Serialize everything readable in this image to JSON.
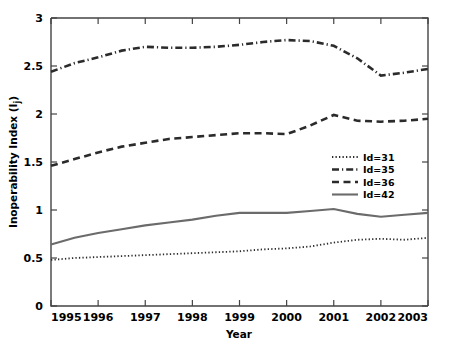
{
  "chart_data": {
    "type": "line",
    "title": "",
    "xlabel": "Year",
    "ylabel": "Inoperability Index (I_j)",
    "ylabel_main": "Inoperability Index (I",
    "ylabel_sub": "j",
    "ylabel_close": ")",
    "x": [
      1995,
      1995.5,
      1996,
      1996.5,
      1997,
      1997.5,
      1998,
      1998.5,
      1999,
      1999.5,
      2000,
      2000.5,
      2001,
      2001.5,
      2002,
      2002.5,
      2003
    ],
    "xticklabels": [
      "1995",
      "1996",
      "1997",
      "1998",
      "1999",
      "2000",
      "2001",
      "2002",
      "2003"
    ],
    "xticks": [
      1995,
      1996,
      1997,
      1998,
      1999,
      2000,
      2001,
      2002,
      2003
    ],
    "yticklabels": [
      "0",
      "0.5",
      "1",
      "1.5",
      "2",
      "2.5",
      "3"
    ],
    "yticks": [
      0,
      0.5,
      1,
      1.5,
      2,
      2.5,
      3
    ],
    "xlim": [
      1995,
      2003
    ],
    "ylim": [
      0,
      3
    ],
    "grid": false,
    "legend_position": "center-right",
    "series": [
      {
        "name": "Id=31",
        "style": "dotted",
        "values": [
          0.48,
          0.5,
          0.51,
          0.52,
          0.53,
          0.54,
          0.55,
          0.56,
          0.57,
          0.59,
          0.6,
          0.62,
          0.66,
          0.69,
          0.7,
          0.69,
          0.71
        ]
      },
      {
        "name": "Id=35",
        "style": "dashdot",
        "values": [
          2.44,
          2.53,
          2.59,
          2.66,
          2.7,
          2.69,
          2.69,
          2.7,
          2.72,
          2.75,
          2.77,
          2.76,
          2.71,
          2.58,
          2.4,
          2.43,
          2.47
        ]
      },
      {
        "name": "Id=36",
        "style": "dashed",
        "values": [
          1.46,
          1.53,
          1.6,
          1.66,
          1.7,
          1.74,
          1.76,
          1.78,
          1.8,
          1.8,
          1.79,
          1.88,
          1.99,
          1.93,
          1.92,
          1.93,
          1.95
        ]
      },
      {
        "name": "Id=42",
        "style": "solid",
        "values": [
          0.64,
          0.71,
          0.76,
          0.8,
          0.84,
          0.87,
          0.9,
          0.94,
          0.97,
          0.97,
          0.97,
          0.99,
          1.01,
          0.96,
          0.93,
          0.95,
          0.97
        ]
      }
    ],
    "legend": [
      {
        "label": "Id=31",
        "style": "dotted"
      },
      {
        "label": "Id=35",
        "style": "dashdot"
      },
      {
        "label": "Id=36",
        "style": "dashed"
      },
      {
        "label": "Id=42",
        "style": "solid"
      }
    ]
  }
}
